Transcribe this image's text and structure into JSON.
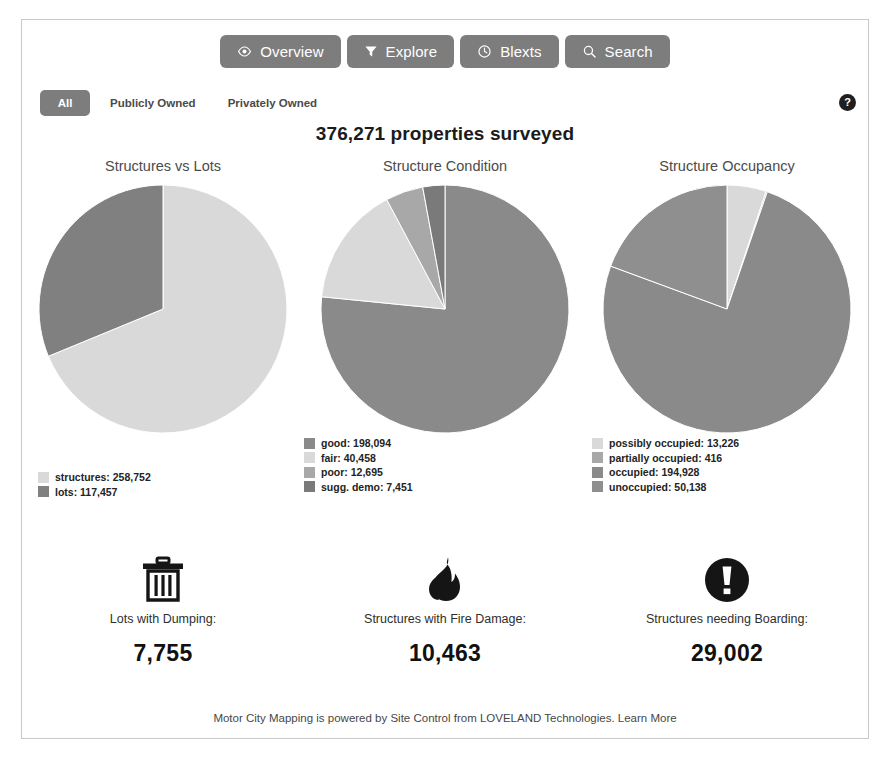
{
  "toolbar": {
    "buttons": [
      {
        "label": "Overview",
        "icon": "eye-icon"
      },
      {
        "label": "Explore",
        "icon": "funnel-icon"
      },
      {
        "label": "Blexts",
        "icon": "clock-icon"
      },
      {
        "label": "Search",
        "icon": "search-icon"
      }
    ]
  },
  "filters": {
    "options": [
      {
        "label": "All",
        "active": true
      },
      {
        "label": "Publicly Owned",
        "active": false
      },
      {
        "label": "Privately Owned",
        "active": false
      }
    ]
  },
  "help": {
    "glyph": "?"
  },
  "headline": "376,271 properties surveyed",
  "colors": {
    "pie_dark": "#808080",
    "pie_mid": "#8a8a8a",
    "pie_light": "#d9d9d9",
    "pie_midlight": "#a8a8a8",
    "button_bg": "#7d7d7d",
    "frame_border": "#c9c9c9"
  },
  "chart_data": [
    {
      "type": "pie",
      "title": "Structures vs Lots",
      "labels": [
        "structures",
        "lots"
      ],
      "values": [
        258752,
        117457
      ],
      "value_labels": [
        "258,752",
        "117,457"
      ],
      "colors": [
        "#d9d9d9",
        "#808080"
      ],
      "legend": [
        "structures: 258,752",
        "lots: 117,457"
      ],
      "legend_position": "below-left",
      "start_angle_deg": 0,
      "direction": "clockwise"
    },
    {
      "type": "pie",
      "title": "Structure Condition",
      "labels": [
        "good",
        "fair",
        "poor",
        "sugg. demo"
      ],
      "values": [
        198094,
        40458,
        12695,
        7451
      ],
      "value_labels": [
        "198,094",
        "40,458",
        "12,695",
        "7,451"
      ],
      "colors": [
        "#8a8a8a",
        "#d9d9d9",
        "#a8a8a8",
        "#7a7a7a"
      ],
      "legend": [
        "good: 198,094",
        "fair: 40,458",
        "poor: 12,695",
        "sugg. demo: 7,451"
      ],
      "legend_position": "below-left",
      "start_angle_deg": 0,
      "direction": "clockwise"
    },
    {
      "type": "pie",
      "title": "Structure Occupancy",
      "labels": [
        "possibly occupied",
        "partially occupied",
        "occupied",
        "unoccupied"
      ],
      "values": [
        13226,
        416,
        194928,
        50138
      ],
      "value_labels": [
        "13,226",
        "416",
        "194,928",
        "50,138"
      ],
      "colors": [
        "#d9d9d9",
        "#a8a8a8",
        "#8a8a8a",
        "#8f8f8f"
      ],
      "legend": [
        "possibly occupied: 13,226",
        "partially occupied: 416",
        "occupied: 194,928",
        "unoccupied: 50,138"
      ],
      "legend_position": "below-left",
      "start_angle_deg": 0,
      "direction": "clockwise"
    }
  ],
  "stats": [
    {
      "icon": "trash-icon",
      "label": "Lots with Dumping:",
      "value": "7,755"
    },
    {
      "icon": "fire-icon",
      "label": "Structures with Fire Damage:",
      "value": "10,463"
    },
    {
      "icon": "exclamation-circle-icon",
      "label": "Structures needing Boarding:",
      "value": "29,002"
    }
  ],
  "footer": {
    "text": "Motor City Mapping is powered by Site Control from LOVELAND Technologies.",
    "link": "Learn More"
  }
}
